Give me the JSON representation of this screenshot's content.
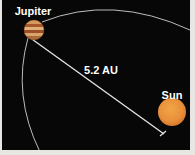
{
  "diagram": {
    "bodies": [
      {
        "name": "Jupiter",
        "color": "#b8682e"
      },
      {
        "name": "Sun",
        "color": "#e8943a"
      }
    ],
    "distance_label": "5.2 AU",
    "colors": {
      "background": "#070707",
      "margin": "#e8e6e3",
      "orbit": "#d8d8d8",
      "line": "#e6e6e6",
      "text": "#ffffff"
    }
  }
}
